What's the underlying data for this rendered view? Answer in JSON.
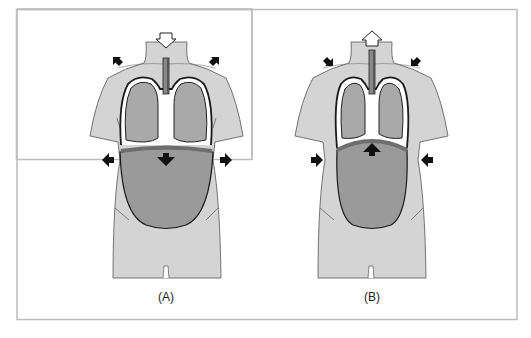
{
  "figure": {
    "panels": [
      {
        "id": "A",
        "label": "(A)",
        "phase": "inhalation",
        "airflow": "in",
        "diaphragm": "down",
        "ribcage": "expands"
      },
      {
        "id": "B",
        "label": "(B)",
        "phase": "exhalation",
        "airflow": "out",
        "diaphragm": "up",
        "ribcage": "contracts"
      }
    ],
    "colors": {
      "body": "#d4d4d4",
      "lung": "#a9a9a9",
      "abdomen": "#9a9a9a",
      "diaphragm": "#6e6e6e",
      "outline": "#1a1a1a",
      "arrow": "#111111",
      "frame": "#bdbdbd"
    }
  }
}
